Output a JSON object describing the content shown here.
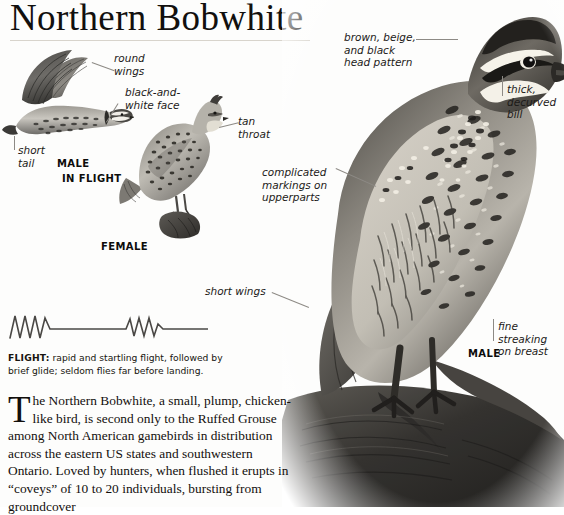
{
  "page": {
    "title": "Northern Bobwhite",
    "background_color": "#fdfdfc",
    "text_color": "#120f0c",
    "leader_color": "#8d8a85"
  },
  "annotations": {
    "round_wings": "round\nwings",
    "black_and_white_face": "black-and-\nwhite face",
    "short_tail": "short\ntail",
    "tan_throat": "tan\nthroat",
    "head_pattern": "brown, beige,\nand black\nhead pattern",
    "thick_bill": "thick,\ndecurved\nbill",
    "complicated_markings": "complicated\nmarkings on\nupperparts",
    "short_wings": "short wings",
    "fine_streaking": "fine streaking\non breast"
  },
  "plate_labels": {
    "male_flight_sex": "MALE",
    "male_flight_pose": "IN FLIGHT",
    "female": "FEMALE",
    "male_large": "MALE"
  },
  "flight": {
    "label": "FLIGHT:",
    "description": " rapid and startling flight, followed by brief glide; seldom flies far before landing.",
    "diagram_name": "flight-path-zigzag"
  },
  "body_text": {
    "dropcap": "T",
    "paragraph": "he Northern Bobwhite, a small, plump, chicken-like bird, is second only to the Ruffed Grouse among North American gamebirds in distribution across the eastern US states and southwestern Ontario. Loved by hunters, when flushed it erupts in “coveys” of 10 to 20 individuals, bursting from groundcover"
  },
  "illustrations": {
    "male_in_flight": "male-bobwhite-in-flight-illustration",
    "female_perched": "female-bobwhite-perched-illustration",
    "male_photo": "male-bobwhite-photograph"
  }
}
